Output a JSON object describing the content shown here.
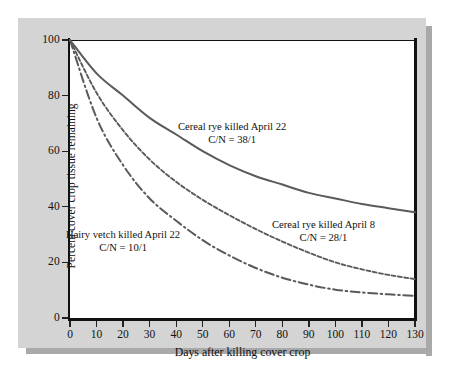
{
  "figure": {
    "panel_background": "#d4d4d4",
    "plot_background": "#ffffff",
    "axis_color": "#111111",
    "curve_color": "#5a5a5a"
  },
  "chart_data": {
    "type": "line",
    "title": "",
    "xlabel": "Days after killing cover crop",
    "ylabel": "Percent cover crop tissue remaining",
    "xlim": [
      0,
      130
    ],
    "ylim": [
      0,
      100
    ],
    "xticks": [
      0,
      10,
      20,
      30,
      40,
      50,
      60,
      70,
      80,
      90,
      100,
      110,
      120,
      130
    ],
    "yticks": [
      0,
      20,
      40,
      60,
      80,
      100
    ],
    "xtick_labels": [
      "0",
      "10",
      "20",
      "30",
      "40",
      "50",
      "60",
      "70",
      "80",
      "90",
      "100",
      "110",
      "120",
      "130"
    ],
    "ytick_labels": [
      "0",
      "20",
      "40",
      "60",
      "80",
      "100"
    ],
    "grid": false,
    "legend": "inline-annotations",
    "x": [
      0,
      10,
      20,
      30,
      40,
      50,
      60,
      70,
      80,
      90,
      100,
      110,
      120,
      130
    ],
    "series": [
      {
        "name": "Cereal rye killed April 22",
        "cn_ratio": "C/N = 38/1",
        "line_style": "solid",
        "color": "#5a5a5a",
        "values": [
          100,
          88,
          80,
          72,
          66,
          60,
          55,
          51,
          48,
          45,
          43,
          41,
          39.5,
          38
        ]
      },
      {
        "name": "Cereal rye killed April 8",
        "cn_ratio": "C/N = 28/1",
        "line_style": "dashed",
        "color": "#5a5a5a",
        "values": [
          100,
          81,
          67.5,
          57,
          49,
          42.5,
          37,
          32,
          27.5,
          23.5,
          20,
          17.5,
          15.5,
          14
        ]
      },
      {
        "name": "Hairy vetch killed April 22",
        "cn_ratio": "C/N = 10/1",
        "line_style": "dash-dot",
        "color": "#5a5a5a",
        "values": [
          100,
          72,
          55,
          43,
          35,
          28,
          22.5,
          18,
          14.5,
          12,
          10.2,
          9.2,
          8.5,
          8
        ]
      }
    ],
    "annotations": [
      {
        "id": "rye-april-22",
        "line1": "Cereal rye killed April 22",
        "line2": "C/N = 38/1"
      },
      {
        "id": "rye-april-8",
        "line1": "Cereal rye killed April 8",
        "line2": "C/N = 28/1"
      },
      {
        "id": "hairy-vetch-april-22",
        "line1": "Hairy vetch killed April 22",
        "line2": "C/N = 10/1"
      }
    ]
  }
}
